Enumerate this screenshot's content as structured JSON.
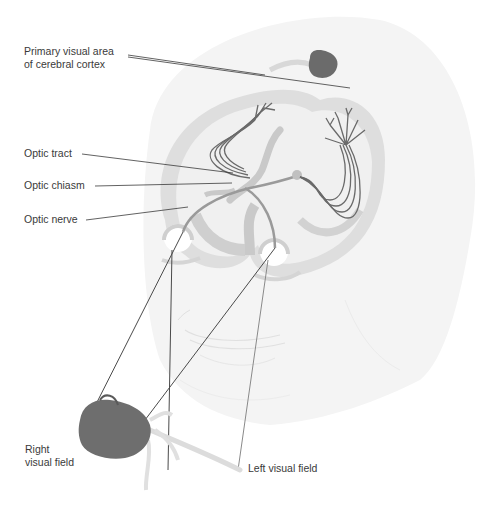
{
  "figure": {
    "labels": {
      "primary_visual_area_line1": "Primary visual area",
      "primary_visual_area_line2": "of cerebral cortex",
      "optic_tract": "Optic tract",
      "optic_chiasm": "Optic chiasm",
      "optic_nerve": "Optic nerve",
      "right_visual_field_line1": "Right",
      "right_visual_field_line2": "visual field",
      "left_visual_field": "Left visual field"
    },
    "colors": {
      "background": "#ffffff",
      "head_fill": "#f3f3f3",
      "brain_gray": "#c8c8c8",
      "brain_dark": "#b3b3b3",
      "pathway": "#5a5a5a",
      "leader_line": "#3a3a3a",
      "rose": "#6b6b6b",
      "stem": "#dcdcdc",
      "text": "#3a3a3a"
    }
  }
}
